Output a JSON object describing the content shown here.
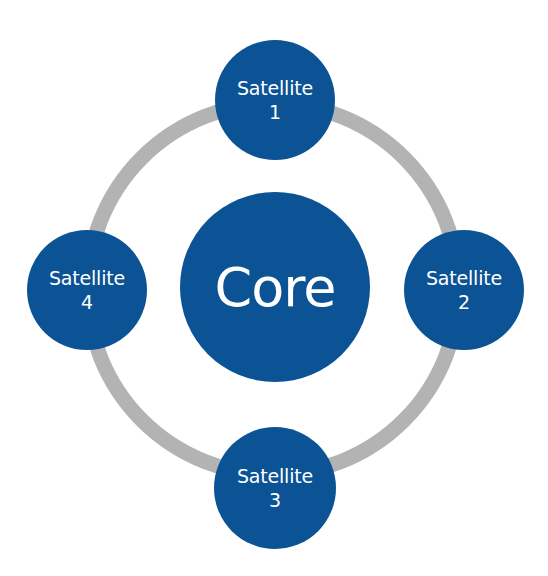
{
  "diagram": {
    "type": "hub-and-satellite",
    "colors": {
      "node_fill": "#0b5394",
      "ring": "#b3b3b3",
      "text": "#ffffff",
      "background": "#ffffff"
    },
    "core": {
      "label": "Core"
    },
    "satellites": [
      {
        "label": "Satellite",
        "number": "1",
        "position": "top"
      },
      {
        "label": "Satellite",
        "number": "2",
        "position": "right"
      },
      {
        "label": "Satellite",
        "number": "3",
        "position": "bottom"
      },
      {
        "label": "Satellite",
        "number": "4",
        "position": "left"
      }
    ]
  }
}
